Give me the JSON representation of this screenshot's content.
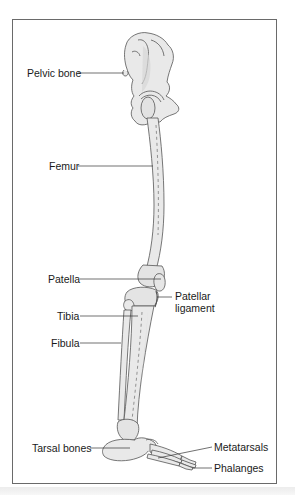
{
  "diagram": {
    "labels": {
      "pelvic_bone": "Pelvic bone",
      "femur": "Femur",
      "patella": "Patella",
      "patellar_ligament_line1": "Patellar",
      "patellar_ligament_line2": "ligament",
      "tibia": "Tibia",
      "fibula": "Fibula",
      "tarsal_bones": "Tarsal bones",
      "metatarsals": "Metatarsals",
      "phalanges": "Phalanges"
    },
    "colors": {
      "bone_fill": "#e9e9e9",
      "bone_shade": "#d2d2d2",
      "outline": "#555555",
      "leader_line": "#333333",
      "frame": "#6a6a6a"
    }
  }
}
